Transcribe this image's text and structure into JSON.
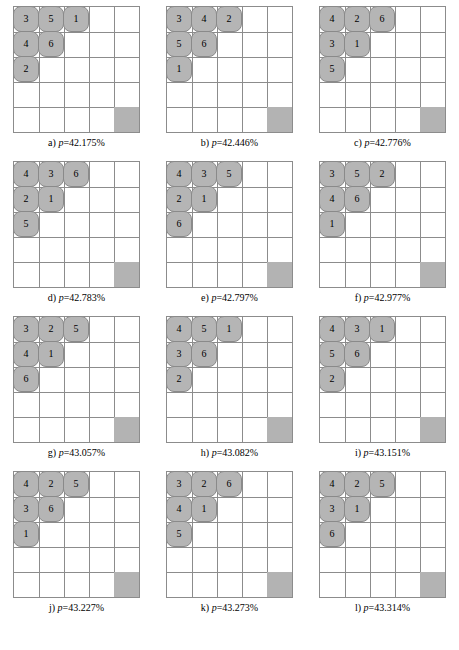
{
  "figure": {
    "rows": 4,
    "columns": 3,
    "board_size": 5,
    "piece_count": 6,
    "colors": {
      "piece_fill": "#b5b5b5",
      "piece_stroke": "#8a8a8a",
      "grid_line": "#8c8c8c",
      "filled_cell": "#b3b3b3",
      "background": "#ffffff",
      "text": "#000000"
    }
  },
  "panels": [
    {
      "id": "a",
      "label": "a)",
      "p_symbol": "p",
      "p_equals": "=",
      "p_value": "42.175%",
      "caption": "a) p=42.175%",
      "filled_cell": {
        "row": 5,
        "col": 5
      },
      "pieces": [
        {
          "value": "3",
          "row": 1,
          "col": 1
        },
        {
          "value": "5",
          "row": 1,
          "col": 2
        },
        {
          "value": "1",
          "row": 1,
          "col": 3
        },
        {
          "value": "4",
          "row": 2,
          "col": 1
        },
        {
          "value": "6",
          "row": 2,
          "col": 2
        },
        {
          "value": "2",
          "row": 3,
          "col": 1
        }
      ]
    },
    {
      "id": "b",
      "label": "b)",
      "p_symbol": "p",
      "p_equals": "=",
      "p_value": "42.446%",
      "caption": "b) p=42.446%",
      "filled_cell": {
        "row": 5,
        "col": 5
      },
      "pieces": [
        {
          "value": "3",
          "row": 1,
          "col": 1
        },
        {
          "value": "4",
          "row": 1,
          "col": 2
        },
        {
          "value": "2",
          "row": 1,
          "col": 3
        },
        {
          "value": "5",
          "row": 2,
          "col": 1
        },
        {
          "value": "6",
          "row": 2,
          "col": 2
        },
        {
          "value": "1",
          "row": 3,
          "col": 1
        }
      ]
    },
    {
      "id": "c",
      "label": "c)",
      "p_symbol": "p",
      "p_equals": "=",
      "p_value": "42.776%",
      "caption": "c) p=42.776%",
      "filled_cell": {
        "row": 5,
        "col": 5
      },
      "pieces": [
        {
          "value": "4",
          "row": 1,
          "col": 1
        },
        {
          "value": "2",
          "row": 1,
          "col": 2
        },
        {
          "value": "6",
          "row": 1,
          "col": 3
        },
        {
          "value": "3",
          "row": 2,
          "col": 1
        },
        {
          "value": "1",
          "row": 2,
          "col": 2
        },
        {
          "value": "5",
          "row": 3,
          "col": 1
        }
      ]
    },
    {
      "id": "d",
      "label": "d)",
      "p_symbol": "p",
      "p_equals": "=",
      "p_value": "42.783%",
      "caption": "d) p=42.783%",
      "filled_cell": {
        "row": 5,
        "col": 5
      },
      "pieces": [
        {
          "value": "4",
          "row": 1,
          "col": 1
        },
        {
          "value": "3",
          "row": 1,
          "col": 2
        },
        {
          "value": "6",
          "row": 1,
          "col": 3
        },
        {
          "value": "2",
          "row": 2,
          "col": 1
        },
        {
          "value": "1",
          "row": 2,
          "col": 2
        },
        {
          "value": "5",
          "row": 3,
          "col": 1
        }
      ]
    },
    {
      "id": "e",
      "label": "e)",
      "p_symbol": "p",
      "p_equals": "=",
      "p_value": "42.797%",
      "caption": "e) p=42.797%",
      "filled_cell": {
        "row": 5,
        "col": 5
      },
      "pieces": [
        {
          "value": "4",
          "row": 1,
          "col": 1
        },
        {
          "value": "3",
          "row": 1,
          "col": 2
        },
        {
          "value": "5",
          "row": 1,
          "col": 3
        },
        {
          "value": "2",
          "row": 2,
          "col": 1
        },
        {
          "value": "1",
          "row": 2,
          "col": 2
        },
        {
          "value": "6",
          "row": 3,
          "col": 1
        }
      ]
    },
    {
      "id": "f",
      "label": "f)",
      "p_symbol": "p",
      "p_equals": "=",
      "p_value": "42.977%",
      "caption": "f) p=42.977%",
      "filled_cell": {
        "row": 5,
        "col": 5
      },
      "pieces": [
        {
          "value": "3",
          "row": 1,
          "col": 1
        },
        {
          "value": "5",
          "row": 1,
          "col": 2
        },
        {
          "value": "2",
          "row": 1,
          "col": 3
        },
        {
          "value": "4",
          "row": 2,
          "col": 1
        },
        {
          "value": "6",
          "row": 2,
          "col": 2
        },
        {
          "value": "1",
          "row": 3,
          "col": 1
        }
      ]
    },
    {
      "id": "g",
      "label": "g)",
      "p_symbol": "p",
      "p_equals": "=",
      "p_value": "43.057%",
      "caption": "g) p=43.057%",
      "filled_cell": {
        "row": 5,
        "col": 5
      },
      "pieces": [
        {
          "value": "3",
          "row": 1,
          "col": 1
        },
        {
          "value": "2",
          "row": 1,
          "col": 2
        },
        {
          "value": "5",
          "row": 1,
          "col": 3
        },
        {
          "value": "4",
          "row": 2,
          "col": 1
        },
        {
          "value": "1",
          "row": 2,
          "col": 2
        },
        {
          "value": "6",
          "row": 3,
          "col": 1
        }
      ]
    },
    {
      "id": "h",
      "label": "h)",
      "p_symbol": "p",
      "p_equals": "=",
      "p_value": "43.082%",
      "caption": "h) p=43.082%",
      "filled_cell": {
        "row": 5,
        "col": 5
      },
      "pieces": [
        {
          "value": "4",
          "row": 1,
          "col": 1
        },
        {
          "value": "5",
          "row": 1,
          "col": 2
        },
        {
          "value": "1",
          "row": 1,
          "col": 3
        },
        {
          "value": "3",
          "row": 2,
          "col": 1
        },
        {
          "value": "6",
          "row": 2,
          "col": 2
        },
        {
          "value": "2",
          "row": 3,
          "col": 1
        }
      ]
    },
    {
      "id": "i",
      "label": "i)",
      "p_symbol": "p",
      "p_equals": "=",
      "p_value": "43.151%",
      "caption": "i) p=43.151%",
      "filled_cell": {
        "row": 5,
        "col": 5
      },
      "pieces": [
        {
          "value": "4",
          "row": 1,
          "col": 1
        },
        {
          "value": "3",
          "row": 1,
          "col": 2
        },
        {
          "value": "1",
          "row": 1,
          "col": 3
        },
        {
          "value": "5",
          "row": 2,
          "col": 1
        },
        {
          "value": "6",
          "row": 2,
          "col": 2
        },
        {
          "value": "2",
          "row": 3,
          "col": 1
        }
      ]
    },
    {
      "id": "j",
      "label": "j)",
      "p_symbol": "p",
      "p_equals": "=",
      "p_value": "43.227%",
      "caption": "j) p=43.227%",
      "filled_cell": {
        "row": 5,
        "col": 5
      },
      "pieces": [
        {
          "value": "4",
          "row": 1,
          "col": 1
        },
        {
          "value": "2",
          "row": 1,
          "col": 2
        },
        {
          "value": "5",
          "row": 1,
          "col": 3
        },
        {
          "value": "3",
          "row": 2,
          "col": 1
        },
        {
          "value": "6",
          "row": 2,
          "col": 2
        },
        {
          "value": "1",
          "row": 3,
          "col": 1
        }
      ]
    },
    {
      "id": "k",
      "label": "k)",
      "p_symbol": "p",
      "p_equals": "=",
      "p_value": "43.273%",
      "caption": "k) p=43.273%",
      "filled_cell": {
        "row": 5,
        "col": 5
      },
      "pieces": [
        {
          "value": "3",
          "row": 1,
          "col": 1
        },
        {
          "value": "2",
          "row": 1,
          "col": 2
        },
        {
          "value": "6",
          "row": 1,
          "col": 3
        },
        {
          "value": "4",
          "row": 2,
          "col": 1
        },
        {
          "value": "1",
          "row": 2,
          "col": 2
        },
        {
          "value": "5",
          "row": 3,
          "col": 1
        }
      ]
    },
    {
      "id": "l",
      "label": "l)",
      "p_symbol": "p",
      "p_equals": "=",
      "p_value": "43.314%",
      "caption": "l) p=43.314%",
      "filled_cell": {
        "row": 5,
        "col": 5
      },
      "pieces": [
        {
          "value": "4",
          "row": 1,
          "col": 1
        },
        {
          "value": "2",
          "row": 1,
          "col": 2
        },
        {
          "value": "5",
          "row": 1,
          "col": 3
        },
        {
          "value": "3",
          "row": 2,
          "col": 1
        },
        {
          "value": "1",
          "row": 2,
          "col": 2
        },
        {
          "value": "6",
          "row": 3,
          "col": 1
        }
      ]
    }
  ]
}
